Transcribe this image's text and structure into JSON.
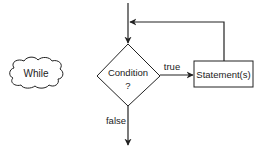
{
  "diagram": {
    "type": "flowchart",
    "title_cloud": {
      "label": "While"
    },
    "decision": {
      "label_line1": "Condition",
      "label_line2": "?"
    },
    "process": {
      "label": "Statement(s)"
    },
    "edges": {
      "true_label": "true",
      "false_label": "false"
    },
    "colors": {
      "stroke": "#222222",
      "fill": "#ffffff",
      "text": "#222222"
    }
  }
}
